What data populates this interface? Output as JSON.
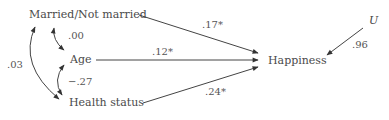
{
  "diagram": {
    "type": "path-diagram",
    "nodes": {
      "married": {
        "label": "Married/Not married"
      },
      "age": {
        "label": "Age"
      },
      "health": {
        "label": "Health status"
      },
      "happiness": {
        "label": "Happiness"
      },
      "u": {
        "label": "U"
      }
    },
    "correlations": [
      {
        "from": "married",
        "to": "age",
        "label": ".00"
      },
      {
        "from": "age",
        "to": "health",
        "label": "−.27"
      },
      {
        "from": "married",
        "to": "health",
        "label": ".03"
      }
    ],
    "paths": [
      {
        "from": "married",
        "to": "happiness",
        "label": ".17*"
      },
      {
        "from": "age",
        "to": "happiness",
        "label": ".12*"
      },
      {
        "from": "health",
        "to": "happiness",
        "label": ".24*"
      },
      {
        "from": "u",
        "to": "happiness",
        "label": ".96"
      }
    ],
    "colors": {
      "line": "#444444",
      "text": "#4a4a4a"
    }
  }
}
